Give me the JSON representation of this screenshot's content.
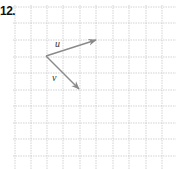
{
  "problem": {
    "number_label": "12."
  },
  "grid": {
    "x_lines": [
      15,
      31,
      47,
      63,
      80,
      96,
      113,
      129,
      146,
      162
    ],
    "y_lines": [
      7,
      23,
      40,
      57,
      73,
      90,
      106,
      123,
      139,
      156
    ],
    "x_extent": [
      13,
      176
    ],
    "y_extent": [
      5,
      169
    ],
    "color": "#c8c8c8"
  },
  "vectors": [
    {
      "name": "u",
      "label": "u",
      "from": [
        46,
        56
      ],
      "to": [
        96,
        40
      ],
      "label_pos": [
        55,
        47
      ],
      "color": "#8a8a8a"
    },
    {
      "name": "v",
      "label": "v",
      "from": [
        46,
        56
      ],
      "to": [
        79,
        89
      ],
      "label_pos": [
        52,
        81
      ],
      "color": "#8a8a8a"
    }
  ]
}
